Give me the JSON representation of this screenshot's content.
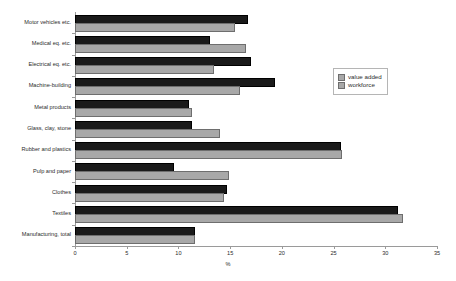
{
  "chart_data": {
    "type": "bar",
    "orientation": "horizontal",
    "title": "",
    "xlabel": "%",
    "ylabel": "",
    "xlim": [
      0,
      35
    ],
    "xticks": [
      0,
      5,
      10,
      15,
      20,
      25,
      30,
      35
    ],
    "grid": false,
    "legend_position": "right",
    "categories": [
      "Motor vehicles etc.",
      "Medical eq. etc.",
      "Electrical eq. etc.",
      "Machine-building",
      "Metal products",
      "Glass, clay, stone",
      "Rubber and plastics",
      "Pulp and paper",
      "Clothes",
      "Textiles",
      "Manufacturing, total"
    ],
    "series": [
      {
        "name": "value added",
        "color": "#a8a8a8",
        "values": [
          15.3,
          16.3,
          13.2,
          15.8,
          11.1,
          13.8,
          25.6,
          14.7,
          14.2,
          31.5,
          11.4
        ]
      },
      {
        "name": "workforce",
        "color": "#1a1a1a",
        "values": [
          16.5,
          12.9,
          16.8,
          19.1,
          10.8,
          11.1,
          25.5,
          9.4,
          14.5,
          31.0,
          11.4
        ]
      }
    ]
  },
  "legend": {
    "items": [
      {
        "label": "value added",
        "swatch": "value-added-swatch"
      },
      {
        "label": "workforce",
        "swatch": "workforce-swatch"
      }
    ]
  },
  "axis": {
    "x_title": "%",
    "tick_labels": [
      "0",
      "5",
      "10",
      "15",
      "20",
      "25",
      "30",
      "35"
    ]
  }
}
